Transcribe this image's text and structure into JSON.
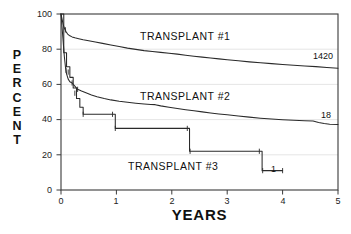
{
  "chart_data": {
    "type": "line",
    "title": "",
    "xlabel": "YEARS",
    "ylabel": "PERCENT",
    "xlim": [
      0,
      5
    ],
    "ylim": [
      0,
      100
    ],
    "xticks": [
      "0",
      "1",
      "2",
      "3",
      "4",
      "5"
    ],
    "xtick_values": [
      0,
      1,
      2,
      3,
      4,
      5
    ],
    "yticks": [
      "0",
      "20",
      "40",
      "60",
      "80",
      "100"
    ],
    "ytick_values": [
      0,
      20,
      40,
      60,
      80,
      100
    ],
    "grid": "horizontal-faint",
    "legend_position": "inline-annotations",
    "series": [
      {
        "name": "TRANSPLANT #1",
        "label": "TRANSPLANT #1",
        "endpoint_label": "1420",
        "endpoint_value": 69,
        "points": [
          [
            0.0,
            100
          ],
          [
            0.02,
            97
          ],
          [
            0.04,
            94
          ],
          [
            0.06,
            92
          ],
          [
            0.09,
            90
          ],
          [
            0.12,
            88.6
          ],
          [
            0.16,
            87.6
          ],
          [
            0.2,
            87.0
          ],
          [
            0.25,
            86.5
          ],
          [
            0.32,
            86.0
          ],
          [
            0.4,
            85.4
          ],
          [
            0.5,
            84.8
          ],
          [
            0.62,
            84.1
          ],
          [
            0.75,
            83.3
          ],
          [
            0.9,
            82.4
          ],
          [
            1.05,
            81.5
          ],
          [
            1.2,
            80.6
          ],
          [
            1.35,
            79.9
          ],
          [
            1.5,
            79.2
          ],
          [
            1.65,
            78.7
          ],
          [
            1.8,
            78.2
          ],
          [
            1.95,
            77.7
          ],
          [
            2.1,
            77.2
          ],
          [
            2.25,
            76.6
          ],
          [
            2.4,
            76.0
          ],
          [
            2.55,
            75.5
          ],
          [
            2.7,
            75.0
          ],
          [
            2.85,
            74.5
          ],
          [
            3.0,
            74.0
          ],
          [
            3.2,
            73.4
          ],
          [
            3.4,
            72.8
          ],
          [
            3.6,
            72.3
          ],
          [
            3.8,
            71.8
          ],
          [
            4.0,
            71.3
          ],
          [
            4.2,
            70.9
          ],
          [
            4.4,
            70.5
          ],
          [
            4.6,
            70.1
          ],
          [
            4.8,
            69.6
          ],
          [
            5.0,
            69.2
          ]
        ]
      },
      {
        "name": "TRANSPLANT #2",
        "label": "TRANSPLANT #2",
        "endpoint_label": "18",
        "endpoint_value": 37,
        "points": [
          [
            0.0,
            100
          ],
          [
            0.02,
            92
          ],
          [
            0.04,
            84
          ],
          [
            0.06,
            76
          ],
          [
            0.08,
            70
          ],
          [
            0.1,
            66
          ],
          [
            0.13,
            63
          ],
          [
            0.16,
            61.5
          ],
          [
            0.2,
            60.8
          ],
          [
            0.25,
            59.0
          ],
          [
            0.3,
            57.2
          ],
          [
            0.37,
            56.2
          ],
          [
            0.45,
            55.2
          ],
          [
            0.55,
            54.0
          ],
          [
            0.65,
            53.0
          ],
          [
            0.78,
            52.0
          ],
          [
            0.9,
            51.2
          ],
          [
            1.05,
            50.4
          ],
          [
            1.2,
            49.8
          ],
          [
            1.35,
            49.3
          ],
          [
            1.5,
            48.9
          ],
          [
            1.62,
            48.6
          ],
          [
            1.7,
            48.5
          ],
          [
            1.8,
            47.8
          ],
          [
            1.95,
            47.0
          ],
          [
            2.1,
            46.3
          ],
          [
            2.25,
            45.6
          ],
          [
            2.4,
            45.0
          ],
          [
            2.55,
            44.4
          ],
          [
            2.7,
            43.8
          ],
          [
            2.85,
            43.2
          ],
          [
            3.0,
            42.7
          ],
          [
            3.2,
            42.0
          ],
          [
            3.4,
            41.4
          ],
          [
            3.6,
            40.8
          ],
          [
            3.8,
            40.3
          ],
          [
            4.0,
            39.9
          ],
          [
            4.2,
            39.6
          ],
          [
            4.4,
            39.4
          ],
          [
            4.55,
            39.2
          ],
          [
            4.65,
            38.4
          ],
          [
            4.75,
            37.8
          ],
          [
            4.85,
            37.4
          ],
          [
            5.0,
            37.2
          ]
        ]
      },
      {
        "name": "TRANSPLANT #3",
        "label": "TRANSPLANT #3",
        "endpoint_label": "1",
        "endpoint_value": 11,
        "step": true,
        "points": [
          [
            0.0,
            100
          ],
          [
            0.05,
            78
          ],
          [
            0.1,
            70
          ],
          [
            0.16,
            64
          ],
          [
            0.22,
            58
          ],
          [
            0.28,
            52
          ],
          [
            0.34,
            47
          ],
          [
            0.4,
            43
          ],
          [
            0.95,
            43
          ],
          [
            0.98,
            35
          ],
          [
            2.28,
            35
          ],
          [
            2.32,
            22
          ],
          [
            3.58,
            22
          ],
          [
            3.63,
            11
          ],
          [
            4.0,
            11
          ]
        ],
        "censor_marks": [
          [
            0.13,
            67
          ],
          [
            0.25,
            55
          ],
          [
            0.4,
            43
          ],
          [
            0.93,
            43
          ],
          [
            0.98,
            35
          ],
          [
            2.28,
            35
          ],
          [
            2.33,
            22
          ],
          [
            3.58,
            22
          ],
          [
            3.64,
            11
          ],
          [
            4.0,
            11
          ]
        ]
      }
    ],
    "censor_marks_series1": [
      [
        0.08,
        91
      ]
    ],
    "censor_marks_series2": [
      [
        0.09,
        68
      ],
      [
        0.2,
        60.8
      ],
      [
        0.3,
        57.2
      ]
    ]
  },
  "annotations": {
    "series1_label": "TRANSPLANT #1",
    "series2_label": "TRANSPLANT #2",
    "series3_label": "TRANSPLANT #3",
    "series1_endpoint": "1420",
    "series2_endpoint": "18",
    "series3_endpoint": "1"
  },
  "axes": {
    "y_title_letters": [
      "P",
      "E",
      "R",
      "C",
      "E",
      "N",
      "T"
    ],
    "x_title": "YEARS",
    "y_tick_labels": [
      "100",
      "80",
      "60",
      "40",
      "20",
      "0"
    ],
    "x_tick_labels": [
      "0",
      "1",
      "2",
      "3",
      "4",
      "5"
    ]
  },
  "colors": {
    "line": "#2a2a2a",
    "axis": "#3a3a3a",
    "grid": "#dcdcdc",
    "text": "#111111",
    "background": "#ffffff"
  }
}
